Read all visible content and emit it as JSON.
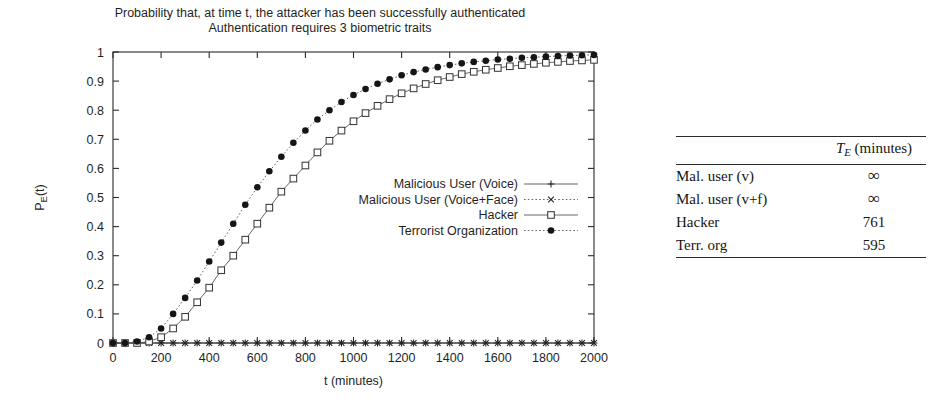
{
  "figure": {
    "title_line1": "Probability that, at time t, the attacker has been successfully authenticated",
    "title_line2": "Authentication requires 3 biometric traits"
  },
  "table": {
    "header_label_blank": "",
    "header_symbol": "T",
    "header_symbol_sub": "E",
    "header_units": "(minutes)",
    "rows": [
      {
        "name": "Mal. user (v)",
        "value": "∞"
      },
      {
        "name": "Mal. user (v+f)",
        "value": "∞"
      },
      {
        "name": "Hacker",
        "value": "761"
      },
      {
        "name": "Terr. org",
        "value": "595"
      }
    ]
  },
  "chart_data": {
    "type": "line",
    "xlabel": "t (minutes)",
    "ylabel": "P_E(t)",
    "xlim": [
      0,
      2000
    ],
    "ylim": [
      0,
      1
    ],
    "xticks": [
      0,
      200,
      400,
      600,
      800,
      1000,
      1200,
      1400,
      1600,
      1800,
      2000
    ],
    "xticklabels": [
      "0",
      "200",
      "400",
      "600",
      "800",
      "1000",
      "1200",
      "1400",
      "1600",
      "1800",
      "2000"
    ],
    "yticks": [
      0,
      0.1,
      0.2,
      0.3,
      0.4,
      0.5,
      0.6,
      0.7,
      0.8,
      0.9,
      1
    ],
    "yticklabels": [
      "0",
      "0.1",
      "0.2",
      "0.3",
      "0.4",
      "0.5",
      "0.6",
      "0.7",
      "0.8",
      "0.9",
      "1"
    ],
    "grid": false,
    "legend_position": "center-right-inside",
    "x": [
      0,
      50,
      100,
      150,
      200,
      250,
      300,
      350,
      400,
      450,
      500,
      550,
      600,
      650,
      700,
      750,
      800,
      850,
      900,
      950,
      1000,
      1050,
      1100,
      1150,
      1200,
      1250,
      1300,
      1350,
      1400,
      1450,
      1500,
      1550,
      1600,
      1650,
      1700,
      1750,
      1800,
      1850,
      1900,
      1950,
      2000
    ],
    "series": [
      {
        "name": "Malicious User (Voice)",
        "marker": "plus",
        "linestyle": "solid",
        "values": [
          0,
          0,
          0,
          0,
          0,
          0,
          0,
          0,
          0,
          0,
          0,
          0,
          0,
          0,
          0,
          0,
          0,
          0,
          0,
          0,
          0,
          0,
          0,
          0,
          0,
          0,
          0,
          0,
          0,
          0,
          0,
          0,
          0,
          0,
          0,
          0,
          0,
          0,
          0,
          0,
          0
        ]
      },
      {
        "name": "Malicious User (Voice+Face)",
        "marker": "cross",
        "linestyle": "dotted",
        "values": [
          0,
          0,
          0,
          0,
          0,
          0,
          0,
          0,
          0,
          0,
          0,
          0,
          0,
          0,
          0,
          0,
          0,
          0,
          0,
          0,
          0,
          0,
          0,
          0,
          0,
          0,
          0,
          0,
          0,
          0,
          0,
          0,
          0,
          0,
          0,
          0,
          0,
          0,
          0,
          0,
          0
        ]
      },
      {
        "name": "Hacker",
        "marker": "open-square",
        "linestyle": "solid",
        "values": [
          0,
          0,
          0,
          0.005,
          0.02,
          0.05,
          0.09,
          0.14,
          0.19,
          0.25,
          0.3,
          0.355,
          0.41,
          0.465,
          0.52,
          0.565,
          0.61,
          0.655,
          0.695,
          0.73,
          0.762,
          0.79,
          0.815,
          0.838,
          0.858,
          0.875,
          0.89,
          0.903,
          0.914,
          0.924,
          0.932,
          0.939,
          0.945,
          0.951,
          0.955,
          0.959,
          0.963,
          0.966,
          0.969,
          0.971,
          0.973
        ]
      },
      {
        "name": "Terrorist Organization",
        "marker": "filled-circle",
        "linestyle": "dotted",
        "values": [
          0,
          0,
          0.005,
          0.02,
          0.05,
          0.1,
          0.155,
          0.215,
          0.28,
          0.345,
          0.41,
          0.475,
          0.535,
          0.59,
          0.64,
          0.688,
          0.73,
          0.768,
          0.8,
          0.828,
          0.852,
          0.873,
          0.891,
          0.906,
          0.92,
          0.931,
          0.94,
          0.948,
          0.955,
          0.961,
          0.966,
          0.97,
          0.974,
          0.977,
          0.98,
          0.982,
          0.984,
          0.986,
          0.988,
          0.989,
          0.99
        ]
      }
    ],
    "legend": [
      "Malicious User (Voice)",
      "Malicious User (Voice+Face)",
      "Hacker",
      "Terrorist Organization"
    ]
  }
}
